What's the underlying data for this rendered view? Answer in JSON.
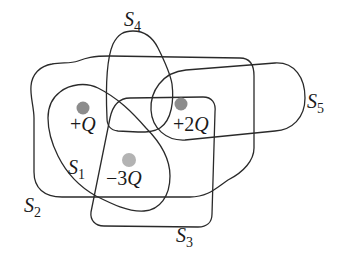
{
  "figure": {
    "type": "gauss-law-surfaces",
    "colors": {
      "stroke": "#2a2a2a",
      "text": "#1a1a1a",
      "charge_dark": "#8c8c8c",
      "charge_light": "#b3b3b3",
      "background": "#ffffff"
    },
    "surfaces": [
      {
        "id": "S1",
        "letter": "S",
        "sub": "1"
      },
      {
        "id": "S2",
        "letter": "S",
        "sub": "2"
      },
      {
        "id": "S3",
        "letter": "S",
        "sub": "3"
      },
      {
        "id": "S4",
        "letter": "S",
        "sub": "4"
      },
      {
        "id": "S5",
        "letter": "S",
        "sub": "5"
      }
    ],
    "charges": [
      {
        "id": "q1",
        "sign": "+",
        "coef": "",
        "symbol": "Q",
        "label": "+Q"
      },
      {
        "id": "q2",
        "sign": "+",
        "coef": "2",
        "symbol": "Q",
        "label": "+2Q"
      },
      {
        "id": "q3",
        "sign": "−",
        "coef": "3",
        "symbol": "Q",
        "label": "−3Q"
      }
    ]
  }
}
